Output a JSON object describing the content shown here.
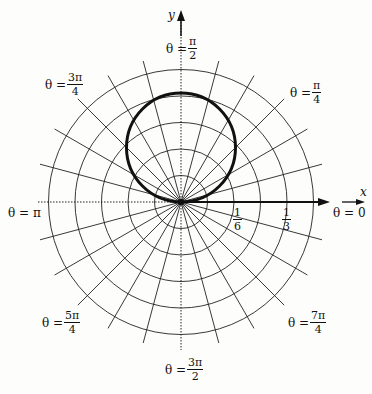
{
  "chart_data": {
    "type": "polar-line",
    "title": "",
    "curve": {
      "description": "circle through the pole, tangent to the x-axis at the origin, lying above the x-axis",
      "equation": "r = (1/3) sin θ (approx., diameter ≈ 1/3 on y-axis)",
      "diameter_units": 0.34,
      "stroke": "#111111"
    },
    "grid": {
      "rings": [
        0.0833,
        0.1667,
        0.25,
        0.3333,
        0.4167
      ],
      "ring_spacing": "1/12",
      "radial_lines_count": 24,
      "radial_spacing_deg": 15
    },
    "radial_tick_labels": [
      {
        "num": "1",
        "den": "6",
        "r": 0.1667
      },
      {
        "num": "1",
        "den": "3",
        "r": 0.3333
      }
    ],
    "axis_labels": {
      "x": "x",
      "y": "y"
    },
    "angle_labels": [
      {
        "key": "theta0",
        "prefix": "θ =",
        "num": "0",
        "den": ""
      },
      {
        "key": "theta_pi_4",
        "prefix": "θ =",
        "num": "π",
        "den": "4"
      },
      {
        "key": "theta_pi_2",
        "prefix": "θ =",
        "num": "π",
        "den": "2"
      },
      {
        "key": "theta_3pi_4",
        "prefix": "θ =",
        "num": "3π",
        "den": "4"
      },
      {
        "key": "theta_pi",
        "prefix": "θ =",
        "num": "π",
        "den": ""
      },
      {
        "key": "theta_5pi_4",
        "prefix": "θ =",
        "num": "5π",
        "den": "4"
      },
      {
        "key": "theta_3pi_2",
        "prefix": "θ =",
        "num": "3π",
        "den": "2"
      },
      {
        "key": "theta_7pi_4",
        "prefix": "θ =",
        "num": "7π",
        "den": "4"
      }
    ],
    "grid_on": true,
    "legend": null
  },
  "labels": {
    "x_axis": "x",
    "y_axis": "y",
    "theta_eq": "θ =",
    "theta0": "θ = 0",
    "theta_pi": "θ = π",
    "theta_pi_2": {
      "num": "π",
      "den": "2"
    },
    "theta_pi_4": {
      "num": "π",
      "den": "4"
    },
    "theta_3pi_4": {
      "num": "3π",
      "den": "4"
    },
    "theta_5pi_4": {
      "num": "5π",
      "den": "4"
    },
    "theta_3pi_2": {
      "num": "3π",
      "den": "2"
    },
    "theta_7pi_4": {
      "num": "7π",
      "den": "4"
    },
    "tick_1_6": {
      "num": "1",
      "den": "6"
    },
    "tick_1_3": {
      "num": "1",
      "den": "3"
    }
  },
  "colors": {
    "ink": "#111111",
    "grid": "#222222",
    "background": "#fdfdfb"
  }
}
